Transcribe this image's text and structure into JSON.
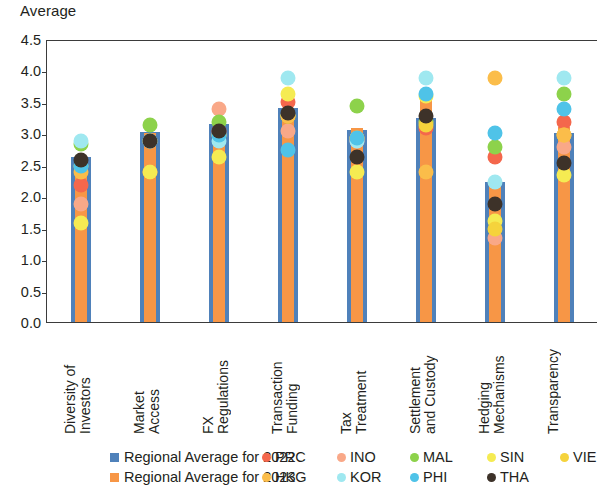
{
  "chart_data": {
    "type": "bar",
    "title": "",
    "ylabel": "Average",
    "xlabel": "",
    "ylim": [
      0.0,
      4.5
    ],
    "yticks": [
      "0.0",
      "0.5",
      "1.0",
      "1.5",
      "2.0",
      "2.5",
      "3.0",
      "3.5",
      "4.0",
      "4.5"
    ],
    "ytick_values": [
      0.0,
      0.5,
      1.0,
      1.5,
      2.0,
      2.5,
      3.0,
      3.5,
      4.0,
      4.5
    ],
    "grid": false,
    "legend_position": "bottom",
    "categories": [
      "Diversity of\nInvestors",
      "Market\nAccess",
      "FX\nRegulations",
      "Transaction\nFunding",
      "Tax\nTreatment",
      "Settlement\nand Custody",
      "Hedging\nMechanisms",
      "Transparency"
    ],
    "series": [
      {
        "name": "Regional Average for 2022",
        "color": "#4f81ba",
        "marker": "bar",
        "values": [
          2.62,
          3.02,
          3.15,
          3.4,
          3.05,
          3.25,
          2.23,
          3.0
        ]
      },
      {
        "name": "Regional Average for 2023",
        "color": "#f79646",
        "marker": "bar",
        "values": [
          2.6,
          3.0,
          3.1,
          3.4,
          3.08,
          3.55,
          2.23,
          3.1
        ]
      },
      {
        "name": "PRC",
        "color": "#f4674c",
        "marker": "dot",
        "values": [
          2.3,
          2.5,
          3.15,
          3.62,
          3.05,
          3.2,
          2.75,
          3.3
        ]
      },
      {
        "name": "INO",
        "color": "#f9a888",
        "marker": "dot",
        "values": [
          2.0,
          3.0,
          3.5,
          3.15,
          3.0,
          3.3,
          1.45,
          2.9
        ]
      },
      {
        "name": "MAL",
        "color": "#8dd24b",
        "marker": "dot",
        "values": [
          2.95,
          3.25,
          3.3,
          3.4,
          3.55,
          3.3,
          2.9,
          3.75
        ]
      },
      {
        "name": "SIN",
        "color": "#f5eb52",
        "marker": "dot",
        "values": [
          1.7,
          2.5,
          2.75,
          3.75,
          2.5,
          3.72,
          1.72,
          2.45
        ]
      },
      {
        "name": "VIE",
        "color": "#f5d33c",
        "marker": "dot",
        "values": [
          2.6,
          3.0,
          3.1,
          3.4,
          3.05,
          3.25,
          1.6,
          3.1
        ]
      },
      {
        "name": "HKG",
        "color": "#fbbd4a",
        "marker": "dot",
        "values": [
          2.5,
          3.0,
          3.1,
          3.4,
          3.05,
          2.5,
          4.0,
          3.1
        ]
      },
      {
        "name": "KOR",
        "color": "#9fe8f0",
        "marker": "dot",
        "values": [
          3.0,
          3.0,
          3.0,
          4.0,
          3.0,
          4.0,
          2.35,
          4.0
        ]
      },
      {
        "name": "PHI",
        "color": "#4fc3e8",
        "marker": "dot",
        "values": [
          2.6,
          3.0,
          3.1,
          2.85,
          3.05,
          3.75,
          3.12,
          3.5
        ]
      },
      {
        "name": "THA",
        "color": "#3d3229",
        "marker": "dot",
        "values": [
          2.7,
          3.0,
          3.15,
          3.45,
          2.75,
          3.4,
          2.0,
          2.65
        ]
      }
    ],
    "annotations": {
      "vie_legend_clipped": "VIE label is clipped at the right edge of the image"
    }
  },
  "legend": {
    "row1": [
      {
        "label": "Regional Average for 2022",
        "color": "#4f81ba",
        "marker": "square",
        "x": 110
      },
      {
        "label": "PRC",
        "color": "#f4674c",
        "marker": "dot",
        "x": 262
      },
      {
        "label": "INO",
        "color": "#f9a888",
        "marker": "dot",
        "x": 337
      },
      {
        "label": "MAL",
        "color": "#8dd24b",
        "marker": "dot",
        "x": 410
      },
      {
        "label": "SIN",
        "color": "#f5eb52",
        "marker": "dot",
        "x": 487
      },
      {
        "label": "VIE",
        "color": "#f5d33c",
        "marker": "dot",
        "x": 560
      }
    ],
    "row2": [
      {
        "label": "Regional Average for 2023",
        "color": "#f79646",
        "marker": "square",
        "x": 110
      },
      {
        "label": "HKG",
        "color": "#fbbd4a",
        "marker": "dot",
        "x": 262
      },
      {
        "label": "KOR",
        "color": "#9fe8f0",
        "marker": "dot",
        "x": 337
      },
      {
        "label": "PHI",
        "color": "#4fc3e8",
        "marker": "dot",
        "x": 410
      },
      {
        "label": "THA",
        "color": "#3d3229",
        "marker": "dot",
        "x": 487
      }
    ]
  }
}
